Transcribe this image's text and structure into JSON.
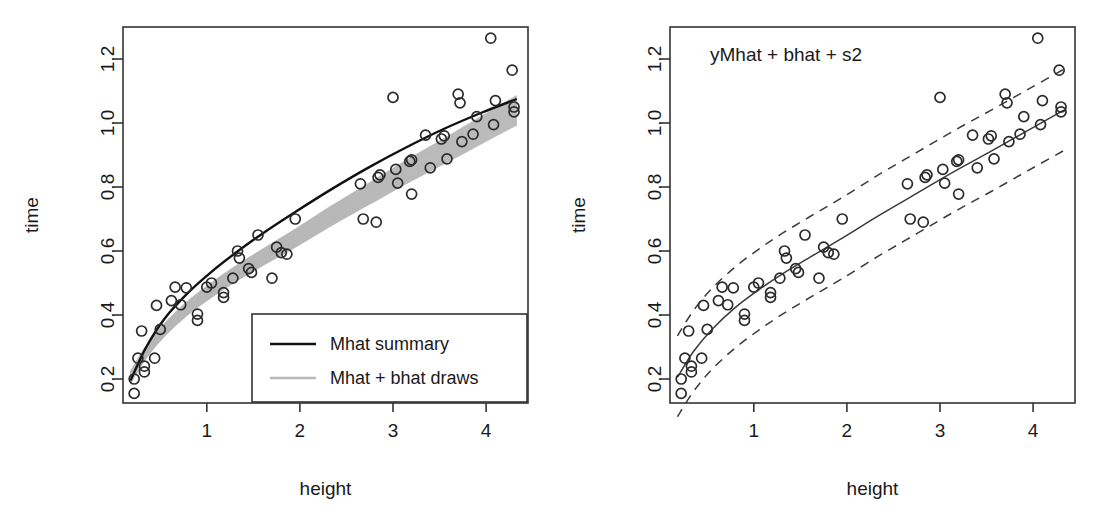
{
  "figure": {
    "width": 1094,
    "height": 526,
    "background": "#ffffff",
    "ink": "#111111",
    "draw_color": "#b8b8b8"
  },
  "chart_data": [
    {
      "id": "left",
      "type": "scatter",
      "title": "",
      "xlabel": "height",
      "ylabel": "time",
      "xlim": [
        0.1,
        4.45
      ],
      "ylim": [
        0.125,
        1.3
      ],
      "xticks": [
        1,
        2,
        3,
        4
      ],
      "xticklabels": [
        "1",
        "2",
        "3",
        "4"
      ],
      "yticks": [
        0.2,
        0.4,
        0.6,
        0.8,
        1.0,
        1.2
      ],
      "yticklabels": [
        "0.2",
        "0.4",
        "0.6",
        "0.8",
        "1.0",
        "1.2"
      ],
      "grid": false,
      "legend_position": "bottom-right",
      "legend": [
        {
          "label": "Mhat summary",
          "color": "#111111",
          "style": "solid"
        },
        {
          "label": "Mhat + bhat draws",
          "color": "#b8b8b8",
          "style": "solid"
        }
      ],
      "points": [
        [
          0.22,
          0.155
        ],
        [
          0.22,
          0.2
        ],
        [
          0.26,
          0.265
        ],
        [
          0.3,
          0.35
        ],
        [
          0.33,
          0.222
        ],
        [
          0.33,
          0.24
        ],
        [
          0.44,
          0.265
        ],
        [
          0.46,
          0.43
        ],
        [
          0.5,
          0.355
        ],
        [
          0.62,
          0.445
        ],
        [
          0.66,
          0.487
        ],
        [
          0.72,
          0.432
        ],
        [
          0.78,
          0.485
        ],
        [
          0.9,
          0.403
        ],
        [
          0.9,
          0.383
        ],
        [
          1.0,
          0.487
        ],
        [
          1.05,
          0.5
        ],
        [
          1.18,
          0.455
        ],
        [
          1.18,
          0.47
        ],
        [
          1.28,
          0.515
        ],
        [
          1.33,
          0.6
        ],
        [
          1.35,
          0.578
        ],
        [
          1.45,
          0.545
        ],
        [
          1.48,
          0.533
        ],
        [
          1.55,
          0.65
        ],
        [
          1.7,
          0.515
        ],
        [
          1.75,
          0.612
        ],
        [
          1.8,
          0.595
        ],
        [
          1.86,
          0.59
        ],
        [
          1.95,
          0.7
        ],
        [
          2.65,
          0.81
        ],
        [
          2.68,
          0.7
        ],
        [
          2.82,
          0.69
        ],
        [
          2.84,
          0.83
        ],
        [
          2.86,
          0.838
        ],
        [
          3.0,
          1.08
        ],
        [
          3.03,
          0.855
        ],
        [
          3.05,
          0.812
        ],
        [
          3.18,
          0.88
        ],
        [
          3.2,
          0.885
        ],
        [
          3.2,
          0.778
        ],
        [
          3.35,
          0.962
        ],
        [
          3.4,
          0.86
        ],
        [
          3.52,
          0.95
        ],
        [
          3.55,
          0.96
        ],
        [
          3.58,
          0.888
        ],
        [
          3.7,
          1.09
        ],
        [
          3.72,
          1.063
        ],
        [
          3.74,
          0.942
        ],
        [
          3.86,
          0.965
        ],
        [
          3.9,
          1.02
        ],
        [
          4.05,
          1.265
        ],
        [
          4.08,
          0.995
        ],
        [
          4.1,
          1.07
        ],
        [
          4.28,
          1.165
        ],
        [
          4.3,
          1.05
        ],
        [
          4.3,
          1.035
        ]
      ],
      "mean_curve": {
        "name": "Mhat summary",
        "color": "#111111",
        "x": [
          0.18,
          0.35,
          0.55,
          0.8,
          1.05,
          1.3,
          1.6,
          1.95,
          2.35,
          2.75,
          3.15,
          3.55,
          3.95,
          4.33
        ],
        "y": [
          0.195,
          0.3,
          0.39,
          0.47,
          0.535,
          0.592,
          0.655,
          0.722,
          0.795,
          0.863,
          0.925,
          0.982,
          1.032,
          1.075
        ]
      },
      "draw_curves": {
        "name": "Mhat + bhat draws",
        "color": "#b8b8b8",
        "count": 60,
        "x": [
          0.18,
          0.35,
          0.55,
          0.8,
          1.05,
          1.3,
          1.6,
          1.95,
          2.35,
          2.75,
          3.15,
          3.55,
          3.95,
          4.33
        ],
        "y_center": [
          0.205,
          0.285,
          0.355,
          0.423,
          0.478,
          0.527,
          0.58,
          0.64,
          0.712,
          0.78,
          0.848,
          0.912,
          0.978,
          1.04
        ],
        "spread_low": 0.022,
        "spread_high": 0.03
      }
    },
    {
      "id": "right",
      "type": "scatter",
      "title": "yMhat + bhat + s2",
      "xlabel": "height",
      "ylabel": "time",
      "xlim": [
        0.1,
        4.45
      ],
      "ylim": [
        0.125,
        1.3
      ],
      "xticks": [
        1,
        2,
        3,
        4
      ],
      "xticklabels": [
        "1",
        "2",
        "3",
        "4"
      ],
      "yticks": [
        0.2,
        0.4,
        0.6,
        0.8,
        1.0,
        1.2
      ],
      "yticklabels": [
        "0.2",
        "0.4",
        "0.6",
        "0.8",
        "1.0",
        "1.2"
      ],
      "grid": false,
      "legend_position": "none",
      "points": [
        [
          0.22,
          0.155
        ],
        [
          0.22,
          0.2
        ],
        [
          0.26,
          0.265
        ],
        [
          0.3,
          0.35
        ],
        [
          0.33,
          0.222
        ],
        [
          0.33,
          0.24
        ],
        [
          0.44,
          0.265
        ],
        [
          0.46,
          0.43
        ],
        [
          0.5,
          0.355
        ],
        [
          0.62,
          0.445
        ],
        [
          0.66,
          0.487
        ],
        [
          0.72,
          0.432
        ],
        [
          0.78,
          0.485
        ],
        [
          0.9,
          0.403
        ],
        [
          0.9,
          0.383
        ],
        [
          1.0,
          0.487
        ],
        [
          1.05,
          0.5
        ],
        [
          1.18,
          0.455
        ],
        [
          1.18,
          0.47
        ],
        [
          1.28,
          0.515
        ],
        [
          1.33,
          0.6
        ],
        [
          1.35,
          0.578
        ],
        [
          1.45,
          0.545
        ],
        [
          1.48,
          0.533
        ],
        [
          1.55,
          0.65
        ],
        [
          1.7,
          0.515
        ],
        [
          1.75,
          0.612
        ],
        [
          1.8,
          0.595
        ],
        [
          1.86,
          0.59
        ],
        [
          1.95,
          0.7
        ],
        [
          2.65,
          0.81
        ],
        [
          2.68,
          0.7
        ],
        [
          2.82,
          0.69
        ],
        [
          2.84,
          0.83
        ],
        [
          2.86,
          0.838
        ],
        [
          3.0,
          1.08
        ],
        [
          3.03,
          0.855
        ],
        [
          3.05,
          0.812
        ],
        [
          3.18,
          0.88
        ],
        [
          3.2,
          0.885
        ],
        [
          3.2,
          0.778
        ],
        [
          3.35,
          0.962
        ],
        [
          3.4,
          0.86
        ],
        [
          3.52,
          0.95
        ],
        [
          3.55,
          0.96
        ],
        [
          3.58,
          0.888
        ],
        [
          3.7,
          1.09
        ],
        [
          3.72,
          1.063
        ],
        [
          3.74,
          0.942
        ],
        [
          3.86,
          0.965
        ],
        [
          3.9,
          1.02
        ],
        [
          4.05,
          1.265
        ],
        [
          4.08,
          0.995
        ],
        [
          4.1,
          1.07
        ],
        [
          4.28,
          1.165
        ],
        [
          4.3,
          1.05
        ],
        [
          4.3,
          1.035
        ]
      ],
      "fit_curve": {
        "name": "posterior mean",
        "color": "#3a3a3a",
        "style": "solid",
        "x": [
          0.18,
          0.35,
          0.55,
          0.8,
          1.05,
          1.3,
          1.6,
          1.95,
          2.35,
          2.75,
          3.15,
          3.55,
          3.95,
          4.33
        ],
        "y": [
          0.205,
          0.285,
          0.355,
          0.423,
          0.478,
          0.527,
          0.58,
          0.64,
          0.712,
          0.78,
          0.848,
          0.912,
          0.978,
          1.04
        ]
      },
      "upper_band": {
        "name": "upper predictive bound",
        "color": "#3a3a3a",
        "style": "dashed",
        "x": [
          0.18,
          0.35,
          0.55,
          0.8,
          1.05,
          1.3,
          1.6,
          1.95,
          2.35,
          2.75,
          3.15,
          3.55,
          3.95,
          4.33
        ],
        "y": [
          0.335,
          0.413,
          0.483,
          0.55,
          0.605,
          0.654,
          0.707,
          0.767,
          0.84,
          0.908,
          0.976,
          1.04,
          1.106,
          1.168
        ]
      },
      "lower_band": {
        "name": "lower predictive bound",
        "color": "#3a3a3a",
        "style": "dashed",
        "x": [
          0.18,
          0.35,
          0.55,
          0.8,
          1.05,
          1.3,
          1.6,
          1.95,
          2.35,
          2.75,
          3.15,
          3.55,
          3.95,
          4.33
        ],
        "y": [
          0.082,
          0.16,
          0.23,
          0.297,
          0.352,
          0.401,
          0.454,
          0.514,
          0.586,
          0.654,
          0.722,
          0.786,
          0.852,
          0.914
        ]
      }
    }
  ]
}
